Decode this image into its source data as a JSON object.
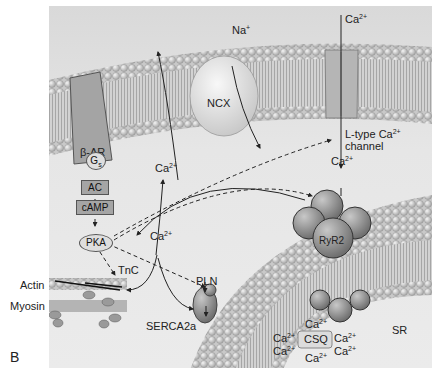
{
  "figure": {
    "panel_label": "B",
    "colors": {
      "background": "#e6e6e6",
      "lipid_head": "#cfcfcf",
      "protein": "#a3a3a3",
      "arrow": "#222222"
    }
  },
  "labels": {
    "na_plus": "Na",
    "na_sup": "+",
    "ca_top": "Ca",
    "ca_top_sup": "2+",
    "ncx": "NCX",
    "beta_ar": "β-AR",
    "gs": "G",
    "gs_sub": "s",
    "ac": "AC",
    "camp": "cAMP",
    "pka": "PKA",
    "ca_ncx": "Ca",
    "ca_ncx_sup": "2+",
    "ca_center": "Ca",
    "ca_center_sup": "2+",
    "ltype_line1": "L-type Ca",
    "ltype_sup": "2+",
    "ltype_line2": "channel",
    "ca_ltype": "Ca",
    "ca_ltype_sup": "2+",
    "ryr2": "RyR2",
    "tnc": "TnC",
    "actin": "Actin",
    "myosin": "Myosin",
    "pln": "PLN",
    "serca": "SERCA2a",
    "sr": "SR",
    "csq": "CSQ",
    "sr_ca": [
      {
        "t": "Ca",
        "s": "2+"
      },
      {
        "t": "Ca",
        "s": "2+"
      },
      {
        "t": "Ca",
        "s": "2+"
      },
      {
        "t": "Ca",
        "s": "2+"
      },
      {
        "t": "Ca",
        "s": "2+"
      },
      {
        "t": "Ca",
        "s": "2+"
      }
    ]
  }
}
